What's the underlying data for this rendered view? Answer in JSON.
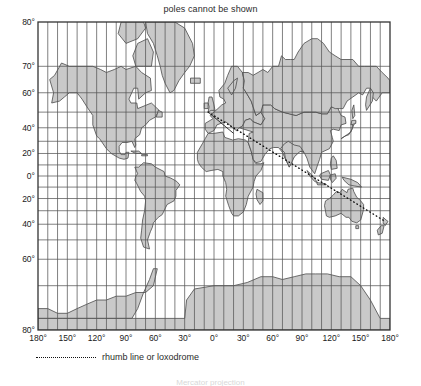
{
  "figure": {
    "title": "poles cannot be shown",
    "footnote": "Mercator projection"
  },
  "axes": {
    "latitude_labels": [
      "80°",
      "70°",
      "60°",
      "40°",
      "20°",
      "0°",
      "20°",
      "40°",
      "60°",
      "80°"
    ],
    "latitude_values": [
      80,
      70,
      60,
      40,
      20,
      0,
      -20,
      -40,
      -60,
      -80
    ],
    "longitude_labels": [
      "180°",
      "150°",
      "120°",
      "90°",
      "60°",
      "30°",
      "0°",
      "30°",
      "60°",
      "90°",
      "120°",
      "150°",
      "180°"
    ],
    "longitude_values": [
      -180,
      -150,
      -120,
      -90,
      -60,
      -30,
      0,
      30,
      60,
      90,
      120,
      150,
      180
    ],
    "graticule_spacing_deg": 10,
    "lat_limit": 80
  },
  "legend": {
    "label": "rhumb line or loxodrome",
    "symbol": "dotted-line"
  },
  "rhumb_line": {
    "start": {
      "lon": -6,
      "lat": 50
    },
    "end": {
      "lon": 175,
      "lat": -38
    },
    "style": "dotted"
  },
  "colors": {
    "land_fill": "#c9c9c9",
    "land_stroke": "#4a4a4a",
    "graticule": "#555555",
    "frame": "#333333",
    "ocean": "#ffffff",
    "text": "#1a1a1a"
  },
  "chart_data": {
    "type": "map",
    "projection": "Mercator",
    "title": "poles cannot be shown",
    "xlabel": "",
    "ylabel": "",
    "xlim": [
      -180,
      180
    ],
    "ylim": [
      -80,
      80
    ],
    "grid": true,
    "legend_position": "below-axis-left",
    "annotations": [
      "rhumb line or loxodrome"
    ]
  }
}
